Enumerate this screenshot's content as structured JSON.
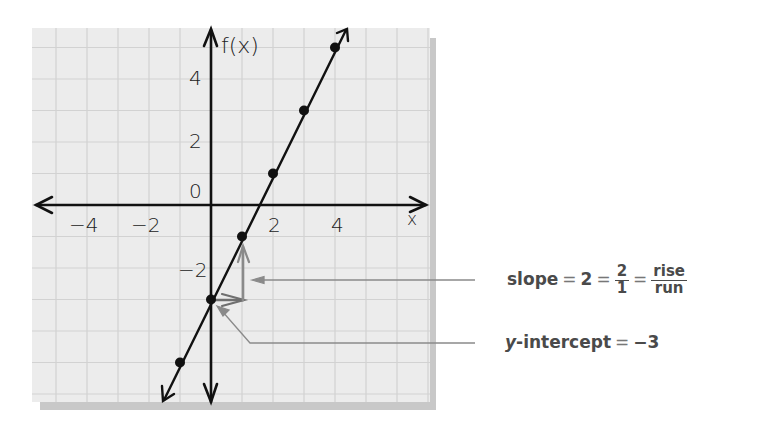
{
  "chart_data": {
    "type": "line",
    "title": "",
    "function_label": "f(x)",
    "xlabel": "x",
    "ylabel": "f(x)",
    "xlim": [
      -6,
      7
    ],
    "ylim": [
      -7,
      5.5
    ],
    "grid": true,
    "x_ticks": [
      -4,
      -2,
      2,
      4
    ],
    "x_tick_labels": [
      "−4",
      "−2",
      "2",
      "4"
    ],
    "y_ticks": [
      4,
      2,
      0,
      -2
    ],
    "y_tick_labels": [
      "4",
      "2",
      "0",
      "−2"
    ],
    "equation": "f(x) = 2x − 3",
    "slope": 2,
    "y_intercept": -3,
    "series": [
      {
        "name": "f(x) = 2x − 3",
        "x": [
          -1,
          0,
          1,
          2,
          3,
          4
        ],
        "y": [
          -5,
          -3,
          -1,
          1,
          3,
          5
        ]
      }
    ],
    "annotations": [
      {
        "text": "slope = 2 = 2/1 = rise/run",
        "points_to": "rise/run arrows from (0,-3) to (1,-1)"
      },
      {
        "text": "y-intercept = −3",
        "points_to": "(0,-3)"
      }
    ],
    "rise_run": {
      "run": 1,
      "rise": 2,
      "start": [
        0,
        -3
      ]
    }
  },
  "labels": {
    "fx": "f(x)",
    "x": "x",
    "zero": "0",
    "xticks": [
      "−4",
      "−2",
      "2",
      "4"
    ],
    "yticks_pos": [
      "4",
      "2"
    ],
    "ytick_neg": "−2"
  },
  "annotation_slope": {
    "word": "slope",
    "eq": "=",
    "value": "2",
    "num": "2",
    "den": "1",
    "rise": "rise",
    "run": "run"
  },
  "annotation_intercept": {
    "var": "y",
    "word": "-intercept",
    "eq": "=",
    "value": "−3"
  },
  "colors": {
    "paper": "#ebebeb",
    "grid": "#cfcfcf",
    "shadow": "#c9c9c9",
    "ink": "#111111",
    "arrow_gray": "#7a7a7a",
    "leader": "#8a8a8a",
    "text": "#4a4a4a"
  }
}
